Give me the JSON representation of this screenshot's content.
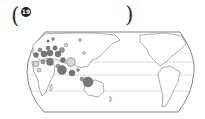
{
  "question": {
    "number_label": "19",
    "open_paren": "(",
    "close_paren": ")"
  },
  "map": {
    "type": "world-map",
    "projection": "pseudo-cylindrical (Pacific-centered)",
    "features": [
      "continents outline",
      "latitude lines",
      "proportional circle symbols"
    ],
    "symbol_colors": {
      "dark": "#777777",
      "light": "#d4d4d4",
      "outline": "#555555"
    },
    "symbol_regions": [
      "Europe",
      "Middle East",
      "South Asia",
      "Southeast Asia",
      "Indonesia",
      "Africa"
    ]
  }
}
